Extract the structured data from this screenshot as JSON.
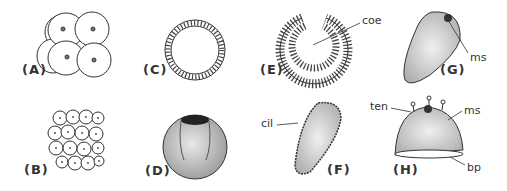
{
  "figure": {
    "panels": [
      {
        "id": "A",
        "label": "(A)",
        "description": "4-cell stage"
      },
      {
        "id": "B",
        "label": "(B)",
        "description": "morula / many-cell cluster"
      },
      {
        "id": "C",
        "label": "(C)",
        "description": "blastula (cross section)"
      },
      {
        "id": "D",
        "label": "(D)",
        "description": "gastrula (external view)"
      },
      {
        "id": "E",
        "label": "(E)",
        "description": "gastrula (cross section)"
      },
      {
        "id": "F",
        "label": "(F)",
        "description": "ciliated larva"
      },
      {
        "id": "G",
        "label": "(G)",
        "description": "larva with mouth"
      },
      {
        "id": "H",
        "label": "(H)",
        "description": "settled polyp"
      }
    ],
    "annotations": {
      "coe": "coe",
      "cil": "cil",
      "ms_g": "ms",
      "ten": "ten",
      "ms_h": "ms",
      "bp": "bp"
    },
    "colors": {
      "ink": "#333333",
      "background": "#ffffff"
    }
  }
}
